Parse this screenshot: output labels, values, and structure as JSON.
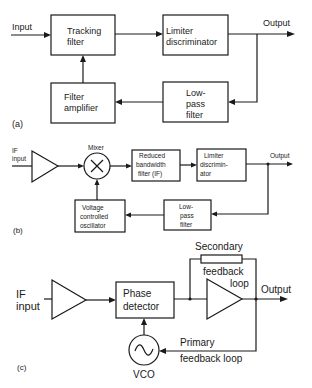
{
  "panel_a": {
    "label": "(a)",
    "input": "Input",
    "output": "Output",
    "tracking_filter": [
      "Tracking",
      "filter"
    ],
    "limiter": [
      "Limiter",
      "discriminator"
    ],
    "filter_amplifier": [
      "Filter",
      "amplifier"
    ],
    "lowpass": [
      "Low-",
      "pass",
      "filter"
    ]
  },
  "panel_b": {
    "label": "(b)",
    "input": [
      "IF",
      "input"
    ],
    "mixer": "Mixer",
    "output": "Output",
    "reduced_filter": [
      "Reduced",
      "bandwidth",
      "filter (IF)"
    ],
    "limiter": [
      "Limiter",
      "discrimin-",
      "ator"
    ],
    "vco": [
      "Voltage",
      "controlled",
      "oscillator"
    ],
    "lowpass": [
      "Low-",
      "pass",
      "filter"
    ]
  },
  "panel_c": {
    "label": "(c)",
    "input": [
      "IF",
      "input"
    ],
    "phase_detector": [
      "Phase",
      "detector"
    ],
    "secondary": [
      "Secondary",
      "feedback",
      "loop"
    ],
    "output": "Output",
    "primary": [
      "Primary",
      "feedback loop"
    ],
    "vco": "VCO"
  }
}
